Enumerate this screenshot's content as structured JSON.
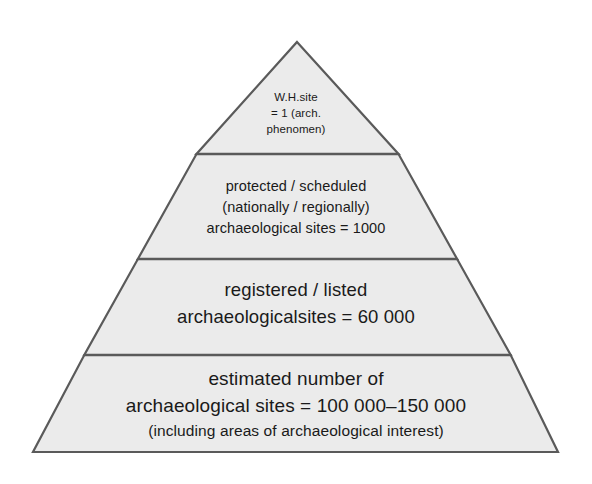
{
  "figure": {
    "type": "pyramid-diagram",
    "name": "archaeological-sites-hierarchy-pyramid",
    "colors": {
      "fill": "#ebebeb",
      "stroke": "#5a5a5a",
      "divider": "#5a5a5a",
      "text": "#1a1a1a",
      "background": "#ffffff"
    },
    "geometry": {
      "apex": [
        297,
        42
      ],
      "base_left": [
        33,
        452
      ],
      "base_right": [
        558,
        452
      ],
      "divider_y": [
        154,
        259,
        355
      ]
    }
  },
  "tiers": [
    {
      "id": "tier-1",
      "level": 1,
      "position": "apex",
      "lines": [
        "W.H.site",
        "= 1 (arch.",
        "phenomen)"
      ],
      "count": "1"
    },
    {
      "id": "tier-2",
      "level": 2,
      "position": "upper-middle",
      "lines": [
        "protected / scheduled",
        "(nationally / regionally)",
        "archaeological sites = 1000"
      ],
      "count": "1000"
    },
    {
      "id": "tier-3",
      "level": 3,
      "position": "lower-middle",
      "lines": [
        "registered / listed",
        "archaeologicalsites = 60 000"
      ],
      "count": "60 000"
    },
    {
      "id": "tier-4",
      "level": 4,
      "position": "base",
      "lines": [
        "estimated number of",
        "archaeological sites = 100 000–150 000",
        "(including areas of archaeological interest)"
      ],
      "count": "100 000–150 000"
    }
  ]
}
